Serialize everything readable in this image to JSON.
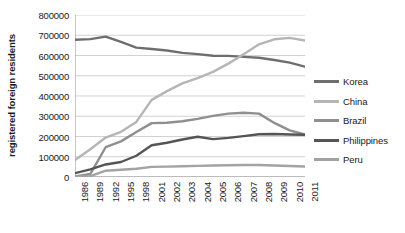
{
  "chart_data": {
    "type": "line",
    "title": "",
    "xlabel": "",
    "ylabel": "registered foreign residents",
    "ylim": [
      0,
      800000
    ],
    "ytick_step": 100000,
    "yticks": [
      "0",
      "100000",
      "200000",
      "300000",
      "400000",
      "500000",
      "600000",
      "700000",
      "800000"
    ],
    "grid": true,
    "grid_axis": "y",
    "legend_position": "right",
    "categories": [
      "1986",
      "1989",
      "1992",
      "1995",
      "1998",
      "2001",
      "2002",
      "2003",
      "2004",
      "2005",
      "2006",
      "2007",
      "2008",
      "2009",
      "2010",
      "2011"
    ],
    "series": [
      {
        "name": "Korea",
        "color": "#6e6e6e",
        "values": [
          678000,
          681000,
          693000,
          667000,
          639000,
          632000,
          625000,
          613000,
          607000,
          599000,
          598000,
          593000,
          589000,
          578000,
          565000,
          545000
        ]
      },
      {
        "name": "China",
        "color": "#b5b5b5",
        "values": [
          84000,
          137000,
          195000,
          223000,
          272000,
          381000,
          424000,
          462000,
          488000,
          519000,
          560000,
          606000,
          655000,
          680000,
          687000,
          674000
        ]
      },
      {
        "name": "Brazil",
        "color": "#8f8f8f",
        "values": [
          2000,
          15000,
          147000,
          176000,
          222000,
          266000,
          268000,
          275000,
          287000,
          302000,
          313000,
          317000,
          313000,
          267000,
          230000,
          210000
        ]
      },
      {
        "name": "Philippines",
        "color": "#555555",
        "values": [
          19000,
          38000,
          62000,
          74000,
          105000,
          157000,
          169000,
          185000,
          199000,
          187000,
          193000,
          202000,
          211000,
          212000,
          210000,
          209000
        ]
      },
      {
        "name": "Peru",
        "color": "#a3a3a3",
        "values": [
          1000,
          4000,
          31000,
          36000,
          41000,
          50000,
          51000,
          53000,
          55000,
          57000,
          58000,
          59000,
          59000,
          57000,
          54000,
          52000
        ]
      }
    ]
  },
  "legend": {
    "items": [
      {
        "label": "Korea"
      },
      {
        "label": "China"
      },
      {
        "label": "Brazil"
      },
      {
        "label": "Philippines"
      },
      {
        "label": "Peru"
      }
    ]
  },
  "axes": {
    "y_title": "registered foreign residents"
  }
}
